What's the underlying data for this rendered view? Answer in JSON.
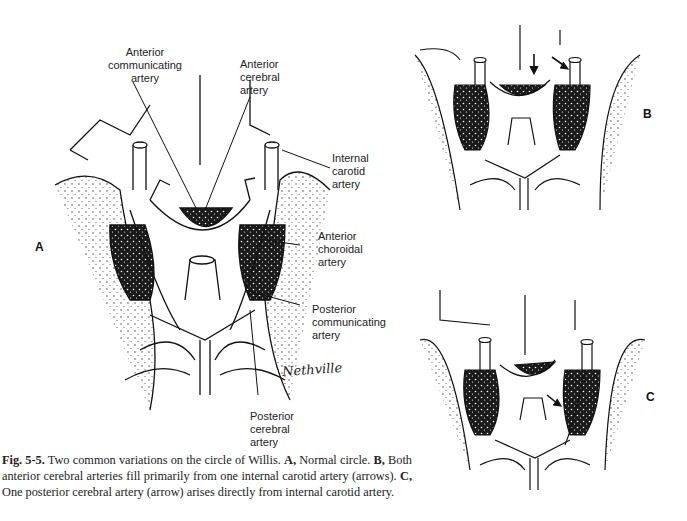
{
  "figure": {
    "panels": [
      {
        "id": "A",
        "letter": "A",
        "description": "Normal circle of Willis"
      },
      {
        "id": "B",
        "letter": "B",
        "description": "Both anterior cerebral arteries fill from one internal carotid artery (arrows)"
      },
      {
        "id": "C",
        "letter": "C",
        "description": "One posterior cerebral artery (arrow) arises directly from internal carotid artery"
      }
    ],
    "labels": {
      "anterior_communicating": [
        "Anterior",
        "communicating",
        "artery"
      ],
      "anterior_cerebral": [
        "Anterior",
        "cerebral",
        "artery"
      ],
      "internal_carotid": [
        "Internal",
        "carotid",
        "artery"
      ],
      "anterior_choroidal": [
        "Anterior",
        "choroidal",
        "artery"
      ],
      "posterior_communicating": [
        "Posterior",
        "communicating",
        "artery"
      ],
      "posterior_cerebral": [
        "Posterior",
        "cerebral",
        "artery"
      ]
    },
    "signature": "Nethville"
  },
  "caption": {
    "fig_number": "Fig. 5-5.",
    "intro": " Two common variations on the circle of Willis. ",
    "a_letter": "A,",
    "a_text": " Normal circle. ",
    "b_letter": "B,",
    "b_text": " Both anterior cerebral arteries fill primarily from one internal carotid artery (arrows). ",
    "c_letter": "C,",
    "c_text": " One posterior cerebral artery (arrow) arises directly from internal carotid artery."
  }
}
